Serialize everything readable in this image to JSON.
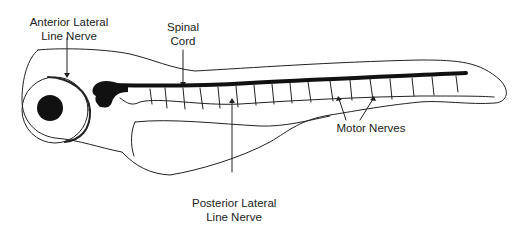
{
  "diagram": {
    "labels": {
      "anterior_lateral_line_nerve": [
        "Anterior Lateral",
        "Line Nerve"
      ],
      "spinal_cord": [
        "Spinal",
        "Cord"
      ],
      "motor_nerves": [
        "Motor Nerves"
      ],
      "posterior_lateral_line_nerve": [
        "Posterior Lateral",
        "Line Nerve"
      ]
    },
    "colors": {
      "outline": "#222222",
      "fill_dark": "#111111",
      "background": "#ffffff"
    }
  }
}
